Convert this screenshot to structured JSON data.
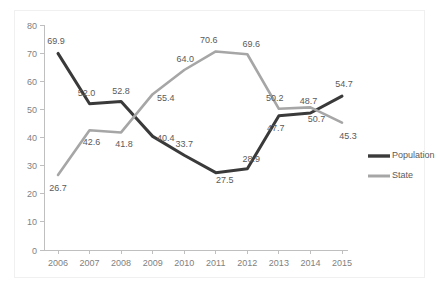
{
  "chart_data": {
    "type": "line",
    "title": "",
    "xlabel": "",
    "ylabel": "",
    "categories": [
      "2006",
      "2007",
      "2008",
      "2009",
      "2010",
      "2011",
      "2012",
      "2013",
      "2014",
      "2015"
    ],
    "ylim": [
      0,
      80
    ],
    "yticks": [
      0,
      10,
      20,
      30,
      40,
      50,
      60,
      70,
      80
    ],
    "grid": false,
    "legend_position": "right",
    "series": [
      {
        "name": "Population",
        "color": "#3a3a3a",
        "values": [
          69.9,
          52.0,
          52.8,
          40.4,
          33.7,
          27.5,
          28.9,
          47.7,
          48.7,
          54.7
        ],
        "labels": [
          "69.9",
          "52.0",
          "52.8",
          "40.4",
          "33.7",
          "27.5",
          "28.9",
          "47.7",
          "48.7",
          "54.7"
        ]
      },
      {
        "name": "State",
        "color": "#a6a6a6",
        "values": [
          26.7,
          42.6,
          41.8,
          55.4,
          64.0,
          70.6,
          69.6,
          50.2,
          50.7,
          45.3
        ],
        "labels": [
          "26.7",
          "42.6",
          "41.8",
          "55.4",
          "64.0",
          "70.6",
          "69.6",
          "50.2",
          "50.7",
          "45.3"
        ]
      }
    ]
  },
  "legend": {
    "items": [
      {
        "label": "Population",
        "color": "#3a3a3a"
      },
      {
        "label": "State",
        "color": "#a6a6a6"
      }
    ]
  },
  "axis": {
    "y_tick_labels": [
      "80",
      "70",
      "60",
      "50",
      "40",
      "30",
      "20",
      "10",
      "0"
    ],
    "x_tick_labels": [
      "2006",
      "2007",
      "2008",
      "2009",
      "2010",
      "2011",
      "2012",
      "2013",
      "2014",
      "2015"
    ]
  }
}
